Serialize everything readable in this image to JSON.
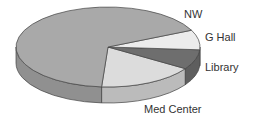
{
  "chart_data": {
    "type": "pie",
    "title": "",
    "style": "3d",
    "slices": [
      {
        "label": "NW",
        "value": 67,
        "color": "#a9a9a9"
      },
      {
        "label": "G Hall",
        "value": 8,
        "color": "#ececec"
      },
      {
        "label": "Library",
        "value": 8,
        "color": "#6e6e6e"
      },
      {
        "label": "Med Center",
        "value": 17,
        "color": "#dcdcdc"
      }
    ]
  }
}
